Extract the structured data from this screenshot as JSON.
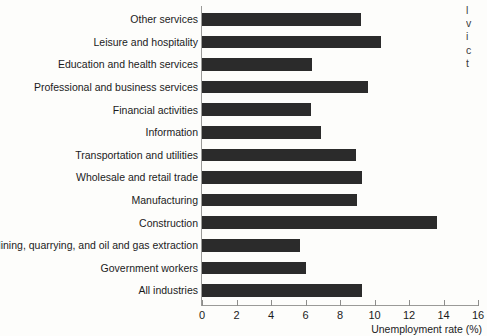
{
  "chart_data": {
    "type": "bar",
    "orientation": "horizontal",
    "title": "",
    "xlabel": "Unemployment rate (%)",
    "ylabel": "",
    "xlim": [
      0,
      16
    ],
    "xticks": [
      0,
      2,
      4,
      6,
      8,
      10,
      12,
      14,
      16
    ],
    "grid": false,
    "legend": null,
    "bar_color": "#2b2b2b",
    "background_color": "#fdfdfb",
    "axis_color": "#9a9a98",
    "categories": [
      "Other services",
      "Leisure and hospitality",
      "Education and health services",
      "Professional and business services",
      "Financial activities",
      "Information",
      "Transportation and utilities",
      "Wholesale and retail trade",
      "Manufacturing",
      "Construction",
      "Mining, quarrying, and oil and gas extraction",
      "Government workers",
      "All industries"
    ],
    "values": [
      9.2,
      10.4,
      6.4,
      9.6,
      6.3,
      6.9,
      8.9,
      9.3,
      9.0,
      13.6,
      5.7,
      6.0,
      9.3
    ]
  },
  "margin_note": {
    "lines": [
      "l",
      "v",
      "i",
      "c",
      "t"
    ]
  }
}
